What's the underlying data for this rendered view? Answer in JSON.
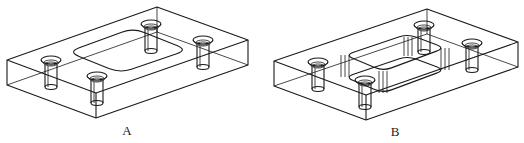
{
  "figures": [
    {
      "id": "A",
      "label": "A",
      "description": "Rectangular plate with four countersunk through-holes and a shallow rounded-rectangle outline on the top face",
      "label_pos": [
        127,
        131
      ],
      "box": {
        "back_top": [
          157,
          7
        ],
        "left_top": [
          7,
          60
        ],
        "front_top": [
          96,
          93
        ],
        "right_top": [
          248,
          40
        ],
        "depth": 25
      },
      "pocket": {
        "type": "outline",
        "left": [
          68,
          52
        ],
        "top": [
          133,
          28
        ],
        "right": [
          188,
          50
        ],
        "bottom": [
          120,
          73
        ],
        "depth": 0
      },
      "holes": [
        [
          51,
          60
        ],
        [
          151,
          24
        ],
        [
          203,
          40
        ],
        [
          97,
          76
        ]
      ]
    },
    {
      "id": "B",
      "label": "B",
      "description": "Rectangular plate with four countersunk through-holes and a raised rounded-rectangle boss",
      "label_pos": [
        395,
        132
      ],
      "box": {
        "back_top": [
          427,
          9
        ],
        "left_top": [
          274,
          61
        ],
        "front_top": [
          366,
          95
        ],
        "right_top": [
          518,
          42
        ],
        "depth": 25
      },
      "pocket": {
        "type": "raised",
        "left": [
          345,
          55
        ],
        "top": [
          408,
          34
        ],
        "right": [
          445,
          48
        ],
        "bottom": [
          383,
          71
        ],
        "depth": 22
      },
      "holes": [
        [
          318,
          62
        ],
        [
          424,
          25
        ],
        [
          472,
          43
        ],
        [
          365,
          80
        ]
      ]
    }
  ],
  "colors": {
    "line": "#1a1a1a",
    "background": "#ffffff"
  }
}
